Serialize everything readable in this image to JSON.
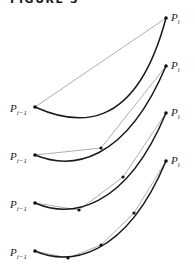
{
  "figure": {
    "title": "FIGURE 3",
    "label_start_main": "P",
    "label_start_sub": "i−1",
    "label_end_main": "P",
    "label_end_sub": "i",
    "colors": {
      "curve": "#1a1a1a",
      "chord": "#999999",
      "point": "#111111"
    }
  },
  "panels": [
    {
      "start": [
        35,
        107
      ],
      "end": [
        166,
        18
      ],
      "ctrl": [
        [
          80,
          140
        ],
        [
          140,
          110
        ]
      ],
      "subdivision_points": []
    },
    {
      "start": [
        35,
        155
      ],
      "end": [
        166,
        66
      ],
      "subdivision_points": [
        [
          101,
          148
        ]
      ]
    },
    {
      "start": [
        35,
        203
      ],
      "end": [
        166,
        113
      ],
      "subdivision_points": [
        [
          79,
          210
        ],
        [
          123,
          177
        ]
      ]
    },
    {
      "start": [
        35,
        251
      ],
      "end": [
        166,
        161
      ],
      "subdivision_points": [
        [
          68,
          258
        ],
        [
          101,
          245
        ],
        [
          134,
          213
        ]
      ]
    }
  ]
}
